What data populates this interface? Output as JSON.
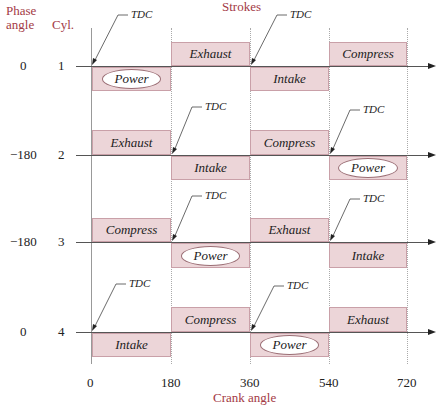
{
  "headers": {
    "phase_angle": "Phase angle",
    "phase_line1": "Phase",
    "phase_line2": "angle",
    "cyl": "Cyl.",
    "strokes": "Strokes",
    "crank_angle": "Crank angle"
  },
  "x_ticks": [
    "0",
    "180",
    "360",
    "540",
    "720"
  ],
  "tdc_label": "TDC",
  "colors": {
    "stroke_box_fill": "#ecd5d8",
    "stroke_box_border": "#c9a0a8",
    "header_text": "#a33a45"
  },
  "cylinders": [
    {
      "phase": "0",
      "cyl": "1",
      "strokes": [
        "Power",
        "Exhaust",
        "Intake",
        "Compress"
      ]
    },
    {
      "phase": "−180",
      "cyl": "2",
      "strokes": [
        "Exhaust",
        "Intake",
        "Compress",
        "Power"
      ]
    },
    {
      "phase": "−180",
      "cyl": "3",
      "strokes": [
        "Compress",
        "Power",
        "Exhaust",
        "Intake"
      ]
    },
    {
      "phase": "0",
      "cyl": "4",
      "strokes": [
        "Intake",
        "Compress",
        "Power",
        "Exhaust"
      ]
    }
  ]
}
